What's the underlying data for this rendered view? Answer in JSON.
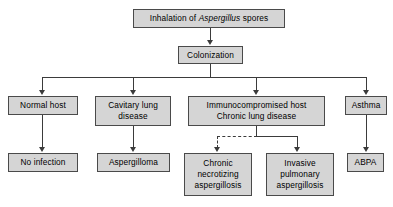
{
  "diagram": {
    "title_text_prefix": "Inhalation of ",
    "title_text_italic": "Aspergillus",
    "title_text_suffix": " spores",
    "colors": {
      "node_fill": "#d5d5d5",
      "node_border": "#4a4a4a",
      "edge": "#3b3b3b",
      "text": "#000000",
      "background": "#ffffff"
    },
    "nodes": {
      "inhalation": "Inhalation of Aspergillus spores",
      "colonization": "Colonization",
      "normal_host": "Normal host",
      "cavitary_lung_disease": "Cavitary lung\ndisease",
      "immunocompromised": "Immunocompromised host\nChronic lung disease",
      "asthma": "Asthma",
      "no_infection": "No infection",
      "aspergilloma": "Aspergilloma",
      "chronic_necrotizing": "Chronic\nnecrotizing\naspergillosis",
      "invasive_pulmonary": "Invasive\npulmonary\naspergillosis",
      "abpa": "ABPA"
    },
    "edges": [
      {
        "from": "inhalation",
        "to": "colonization",
        "style": "solid"
      },
      {
        "from": "colonization",
        "to": "normal_host",
        "style": "solid"
      },
      {
        "from": "colonization",
        "to": "cavitary_lung_disease",
        "style": "solid"
      },
      {
        "from": "colonization",
        "to": "immunocompromised",
        "style": "solid"
      },
      {
        "from": "colonization",
        "to": "asthma",
        "style": "solid"
      },
      {
        "from": "normal_host",
        "to": "no_infection",
        "style": "solid"
      },
      {
        "from": "cavitary_lung_disease",
        "to": "aspergilloma",
        "style": "solid"
      },
      {
        "from": "immunocompromised",
        "to": "chronic_necrotizing",
        "style": "dashed"
      },
      {
        "from": "immunocompromised",
        "to": "invasive_pulmonary",
        "style": "solid"
      },
      {
        "from": "asthma",
        "to": "abpa",
        "style": "solid"
      }
    ]
  }
}
